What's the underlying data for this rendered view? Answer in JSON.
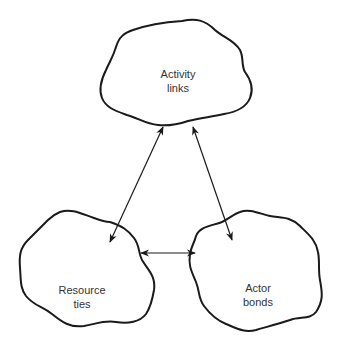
{
  "diagram": {
    "type": "triangle-relationship",
    "nodes": [
      {
        "id": "activity",
        "line1": "Activity",
        "line2": "links"
      },
      {
        "id": "resource",
        "line1": "Resource",
        "line2": "ties"
      },
      {
        "id": "actor",
        "line1": "Actor",
        "line2": "bonds"
      }
    ],
    "edges": [
      {
        "from": "activity",
        "to": "resource",
        "direction": "bidirectional"
      },
      {
        "from": "activity",
        "to": "actor",
        "direction": "bidirectional"
      },
      {
        "from": "resource",
        "to": "actor",
        "direction": "bidirectional"
      }
    ],
    "colors": {
      "stroke": "#1a1a1a",
      "text": "#333333",
      "background": "#ffffff"
    }
  }
}
